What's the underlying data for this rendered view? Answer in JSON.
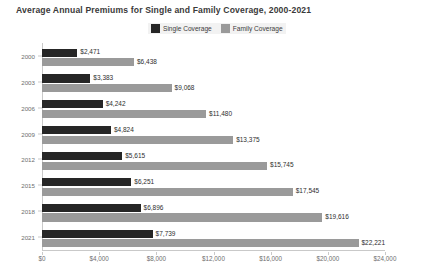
{
  "chart_data": {
    "type": "bar",
    "orientation": "horizontal",
    "title": "Average Annual Premiums for Single and Family Coverage, 2000-2021",
    "xlabel": "",
    "ylabel": "",
    "categories": [
      "2000",
      "2003",
      "2006",
      "2009",
      "2012",
      "2015",
      "2018",
      "2021"
    ],
    "series": [
      {
        "name": "Single Coverage",
        "color": "#262626",
        "values": [
          2471,
          3383,
          4242,
          4824,
          5615,
          6251,
          6896,
          7739
        ],
        "labels": [
          "$2,471",
          "$3,383",
          "$4,242",
          "$4,824",
          "$5,615",
          "$6,251",
          "$6,896",
          "$7,739"
        ]
      },
      {
        "name": "Family Coverage",
        "color": "#9a9a9a",
        "values": [
          6438,
          9068,
          11480,
          13375,
          15745,
          17545,
          19616,
          22221
        ],
        "labels": [
          "$6,438",
          "$9,068",
          "$11,480",
          "$13,375",
          "$15,745",
          "$17,545",
          "$19,616",
          "$22,221"
        ]
      }
    ],
    "xticks": [
      0,
      4000,
      8000,
      12000,
      16000,
      20000,
      24000
    ],
    "xticklabels": [
      "$0",
      "$4,000",
      "$8,000",
      "$12,000",
      "$16,000",
      "$20,000",
      "$24,000"
    ],
    "xlim": [
      0,
      24000
    ],
    "grid": false,
    "legend_position": "top-center"
  },
  "legend": {
    "items": [
      {
        "label": "Single Coverage",
        "color": "#262626"
      },
      {
        "label": "Family Coverage",
        "color": "#9a9a9a"
      }
    ]
  }
}
